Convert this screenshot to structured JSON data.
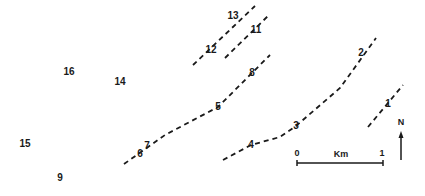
{
  "map": {
    "background": "#ffffff",
    "ink_color": "#1a1a1a",
    "lines": [
      {
        "id": "line-13-12",
        "points": [
          [
            193,
            65
          ],
          [
            255,
            6
          ]
        ]
      },
      {
        "id": "line-11",
        "points": [
          [
            225,
            58
          ],
          [
            270,
            14
          ]
        ]
      },
      {
        "id": "line-8-5-7-6",
        "points": [
          [
            124,
            164
          ],
          [
            165,
            135
          ],
          [
            218,
            107
          ],
          [
            252,
            73
          ],
          [
            270,
            55
          ]
        ]
      },
      {
        "id": "line-4-3-2",
        "points": [
          [
            223,
            160
          ],
          [
            251,
            145
          ],
          [
            280,
            137
          ],
          [
            296,
            126
          ],
          [
            340,
            88
          ],
          [
            376,
            38
          ]
        ]
      },
      {
        "id": "line-1",
        "points": [
          [
            368,
            127
          ],
          [
            403,
            85
          ]
        ]
      }
    ],
    "points": [
      {
        "label": "1",
        "x": 388,
        "y": 104
      },
      {
        "label": "2",
        "x": 361,
        "y": 53
      },
      {
        "label": "3",
        "x": 296,
        "y": 126
      },
      {
        "label": "4",
        "x": 251,
        "y": 145
      },
      {
        "label": "5",
        "x": 218,
        "y": 107
      },
      {
        "label": "6",
        "x": 140,
        "y": 154
      },
      {
        "label": "7",
        "x": 147,
        "y": 146
      },
      {
        "label": "8",
        "x": 252,
        "y": 73
      },
      {
        "label": "9",
        "x": 60,
        "y": 178
      },
      {
        "label": "11",
        "x": 256,
        "y": 30
      },
      {
        "label": "12",
        "x": 211,
        "y": 50
      },
      {
        "label": "13",
        "x": 233,
        "y": 16
      },
      {
        "label": "14",
        "x": 120,
        "y": 82
      },
      {
        "label": "15",
        "x": 25,
        "y": 144
      },
      {
        "label": "16",
        "x": 69,
        "y": 72
      }
    ],
    "scale_bar": {
      "start_label": "0",
      "unit_label": "Km",
      "end_label": "1",
      "x1": 297,
      "x2": 383,
      "y": 163
    },
    "north_arrow": {
      "label": "N",
      "x": 401,
      "y_top": 131,
      "y_bottom": 160
    }
  }
}
